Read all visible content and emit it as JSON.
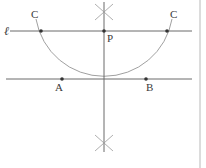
{
  "figure": {
    "background_color": "#ffffff",
    "stroke_color": "#6b6b6b",
    "label_color": "#3a3a3a",
    "border_color": "#b9b9b9",
    "width": 206,
    "height": 168
  },
  "labels": {
    "line_l": "ℓ",
    "point_c_left": "C",
    "point_c_right": "C",
    "point_p": "P",
    "point_a": "A",
    "point_b": "B"
  },
  "geometry": {
    "line_l": {
      "x1": 10,
      "y1": 31,
      "x2": 192,
      "y2": 31
    },
    "line_ab": {
      "x1": 6,
      "y1": 79,
      "x2": 192,
      "y2": 79
    },
    "vertical_line": {
      "x1": 104,
      "y1": 2,
      "x2": 104,
      "y2": 152
    },
    "arc_center": {
      "x": 104,
      "y": 31
    },
    "arc_radius": 69,
    "point_c_left": {
      "x": 41,
      "y": 31
    },
    "point_c_right": {
      "x": 167,
      "y": 31
    },
    "point_p": {
      "x": 104,
      "y": 31
    },
    "point_a": {
      "x": 62,
      "y": 79
    },
    "point_b": {
      "x": 146,
      "y": 79
    },
    "cross_top": {
      "x": 104,
      "y": 12
    },
    "cross_bottom": {
      "x": 104,
      "y": 143
    },
    "right_border_x": 200
  }
}
